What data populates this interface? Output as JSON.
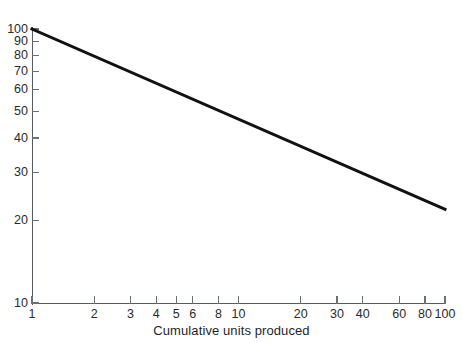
{
  "chart_data": {
    "type": "line",
    "title": "",
    "subtitle": "",
    "xlabel": "Cumulative units produced",
    "ylabel": "",
    "xscale": "log",
    "yscale": "log",
    "xlim": [
      1,
      100
    ],
    "ylim": [
      10,
      100
    ],
    "grid": false,
    "legend": null,
    "annotations": [],
    "x_ticks": [
      {
        "value": 1,
        "label": "1"
      },
      {
        "value": 2,
        "label": "2"
      },
      {
        "value": 3,
        "label": "3"
      },
      {
        "value": 4,
        "label": "4"
      },
      {
        "value": 5,
        "label": "5"
      },
      {
        "value": 6,
        "label": "6"
      },
      {
        "value": 8,
        "label": "8"
      },
      {
        "value": 10,
        "label": "10"
      },
      {
        "value": 20,
        "label": "20"
      },
      {
        "value": 30,
        "label": "30"
      },
      {
        "value": 40,
        "label": "40"
      },
      {
        "value": 60,
        "label": "60"
      },
      {
        "value": 80,
        "label": "80"
      },
      {
        "value": 100,
        "label": "100"
      }
    ],
    "y_ticks": [
      {
        "value": 100,
        "label": "100"
      },
      {
        "value": 90,
        "label": "90"
      },
      {
        "value": 80,
        "label": "80"
      },
      {
        "value": 70,
        "label": "70"
      },
      {
        "value": 60,
        "label": "60"
      },
      {
        "value": 50,
        "label": "50"
      },
      {
        "value": 40,
        "label": "40"
      },
      {
        "value": 30,
        "label": "30"
      },
      {
        "value": 20,
        "label": "20"
      },
      {
        "value": 10,
        "label": "10"
      }
    ],
    "series": [
      {
        "name": "learning curve",
        "color": "#111111",
        "line_width": 3,
        "x": [
          1,
          2,
          3,
          4,
          5,
          6,
          8,
          10,
          20,
          30,
          40,
          60,
          80,
          100
        ],
        "y": [
          100,
          78.6,
          68.0,
          61.8,
          57.5,
          53.5,
          48.6,
          44.0,
          34.6,
          30.0,
          27.2,
          23.6,
          21.4,
          22.0
        ]
      }
    ],
    "line_endpoints": {
      "start": {
        "x": 1,
        "y": 100
      },
      "end": {
        "x": 100,
        "y": 22
      }
    },
    "colors": {
      "line": "#111111",
      "axis": "#555b5e",
      "tick": "#6a7073",
      "text": "#1f1f1f",
      "background": "#ffffff"
    }
  }
}
